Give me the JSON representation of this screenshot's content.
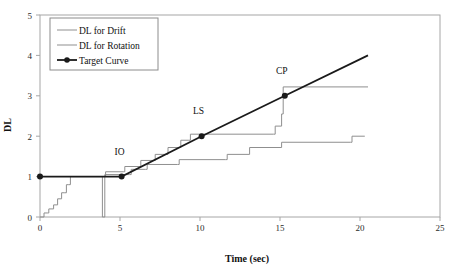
{
  "chart_data": {
    "type": "line",
    "title": "",
    "xlabel": "Time (sec)",
    "ylabel": "DL",
    "xlim": [
      0,
      25
    ],
    "ylim": [
      0,
      5
    ],
    "xticks": [
      0,
      5,
      10,
      15,
      20,
      25
    ],
    "yticks": [
      0,
      1,
      2,
      3,
      4,
      5
    ],
    "xtick_labels": [
      "0",
      "5",
      "10",
      "15",
      "20",
      "25"
    ],
    "ytick_labels": [
      "0",
      "1",
      "2",
      "3",
      "4",
      "5"
    ],
    "grid": false,
    "legend_position": "top-left",
    "series": [
      {
        "name": "DL for Drift",
        "color": "#8f8f8f",
        "width": 1,
        "marker": "none",
        "step": true,
        "points": [
          [
            0.0,
            0.0
          ],
          [
            0.25,
            0.1
          ],
          [
            0.45,
            0.1
          ],
          [
            0.55,
            0.2
          ],
          [
            0.75,
            0.2
          ],
          [
            0.85,
            0.3
          ],
          [
            1.0,
            0.3
          ],
          [
            1.1,
            0.45
          ],
          [
            1.25,
            0.45
          ],
          [
            1.35,
            0.6
          ],
          [
            1.55,
            0.6
          ],
          [
            1.65,
            0.8
          ],
          [
            1.8,
            0.8
          ],
          [
            1.9,
            1.0
          ],
          [
            3.85,
            1.0
          ],
          [
            3.9,
            0.0
          ],
          [
            3.95,
            0.0
          ],
          [
            4.05,
            1.05
          ],
          [
            5.6,
            1.05
          ],
          [
            5.7,
            1.18
          ],
          [
            6.6,
            1.18
          ],
          [
            6.7,
            1.3
          ],
          [
            8.6,
            1.3
          ],
          [
            8.7,
            1.42
          ],
          [
            11.6,
            1.42
          ],
          [
            11.7,
            1.55
          ],
          [
            13.0,
            1.55
          ],
          [
            13.1,
            1.72
          ],
          [
            15.0,
            1.72
          ],
          [
            15.1,
            1.85
          ],
          [
            19.4,
            1.85
          ],
          [
            19.5,
            2.0
          ],
          [
            20.3,
            2.0
          ]
        ]
      },
      {
        "name": "DL for Rotation",
        "color": "#8f8f8f",
        "width": 1,
        "marker": "none",
        "step": true,
        "points": [
          [
            3.85,
            1.0
          ],
          [
            4.0,
            1.0
          ],
          [
            4.1,
            1.12
          ],
          [
            5.2,
            1.12
          ],
          [
            5.3,
            1.25
          ],
          [
            6.2,
            1.25
          ],
          [
            6.3,
            1.4
          ],
          [
            7.1,
            1.4
          ],
          [
            7.2,
            1.55
          ],
          [
            7.9,
            1.55
          ],
          [
            8.0,
            1.72
          ],
          [
            8.7,
            1.72
          ],
          [
            8.8,
            1.9
          ],
          [
            9.3,
            1.9
          ],
          [
            9.4,
            2.05
          ],
          [
            14.6,
            2.05
          ],
          [
            14.7,
            2.25
          ],
          [
            15.0,
            2.25
          ],
          [
            15.1,
            2.55
          ],
          [
            15.2,
            3.22
          ],
          [
            20.5,
            3.22
          ]
        ]
      },
      {
        "name": "Target Curve",
        "color": "#1a1a1a",
        "width": 1.8,
        "marker": "circle",
        "step": false,
        "points": [
          [
            0.0,
            1.0
          ],
          [
            5.1,
            1.0
          ],
          [
            10.1,
            2.0
          ],
          [
            15.3,
            3.0
          ],
          [
            20.5,
            4.0
          ]
        ],
        "marker_points": [
          [
            0.0,
            1.0
          ],
          [
            5.1,
            1.0
          ],
          [
            10.1,
            2.0
          ],
          [
            15.3,
            3.0
          ]
        ]
      }
    ],
    "annotations": [
      {
        "text": "IO",
        "x": 5.1,
        "y": 1.0,
        "dx": -2,
        "dy": -22
      },
      {
        "text": "LS",
        "x": 10.1,
        "y": 2.0,
        "dx": -3,
        "dy": -22
      },
      {
        "text": "CP",
        "x": 15.3,
        "y": 3.0,
        "dx": -3,
        "dy": -22
      }
    ],
    "legend_entries": [
      {
        "label": "DL for Drift",
        "color": "#8f8f8f",
        "marker": "none"
      },
      {
        "label": "DL for Rotation",
        "color": "#8f8f8f",
        "marker": "none"
      },
      {
        "label": "Target Curve",
        "color": "#1a1a1a",
        "marker": "circle"
      }
    ]
  }
}
